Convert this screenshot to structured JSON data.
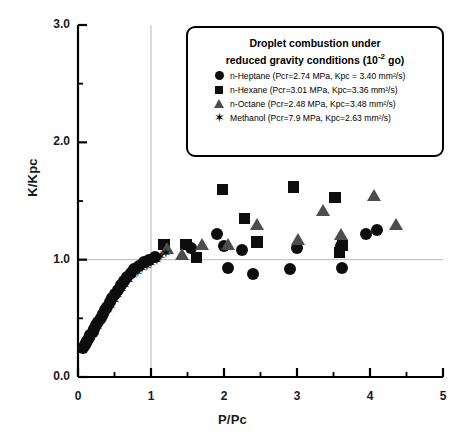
{
  "chart_data": {
    "type": "scatter",
    "title": "",
    "xlabel": "P/Pc",
    "ylabel": "K/Kpc",
    "xlim": [
      0,
      5
    ],
    "ylim": [
      0,
      3.0
    ],
    "xticks": [
      0,
      1,
      2,
      3,
      4,
      5
    ],
    "xtick_labels": [
      "0",
      "1",
      "2",
      "3",
      "4",
      "5"
    ],
    "yticks": [
      0.0,
      1.0,
      2.0,
      3.0
    ],
    "ytick_labels": [
      "0.0",
      "1.0",
      "2.0",
      "3.0"
    ],
    "minor_xtick_interval": 0.5,
    "minor_ytick_interval": 0.5,
    "grid": "reference lines at x=1.0 and y=1.0",
    "gridlines": {
      "vertical": [
        1.0
      ],
      "horizontal": [
        1.0
      ],
      "color": "#b9b9b9"
    },
    "legend_position": "top-right inside plot",
    "legend_title_line1": "Droplet combustion under",
    "legend_title_line2": "reduced gravity conditions (10-2 go)",
    "series": [
      {
        "name": "n-Heptane",
        "marker": "circle",
        "color": "#0d0d0d",
        "label": "n-Heptane (Pcr=2.74 MPa, Kpc = 3.40 mm²/s)",
        "Pcr_MPa": 2.74,
        "Kpc_mm2_s": 3.4,
        "points": [
          [
            0.07,
            0.25
          ],
          [
            0.09,
            0.27
          ],
          [
            0.11,
            0.29
          ],
          [
            0.13,
            0.31
          ],
          [
            0.15,
            0.33
          ],
          [
            0.17,
            0.36
          ],
          [
            0.2,
            0.38
          ],
          [
            0.22,
            0.41
          ],
          [
            0.25,
            0.44
          ],
          [
            0.28,
            0.47
          ],
          [
            0.31,
            0.5
          ],
          [
            0.34,
            0.54
          ],
          [
            0.37,
            0.57
          ],
          [
            0.4,
            0.6
          ],
          [
            0.44,
            0.64
          ],
          [
            0.47,
            0.67
          ],
          [
            0.51,
            0.71
          ],
          [
            0.55,
            0.74
          ],
          [
            0.59,
            0.78
          ],
          [
            0.63,
            0.82
          ],
          [
            0.67,
            0.85
          ],
          [
            0.72,
            0.89
          ],
          [
            0.77,
            0.92
          ],
          [
            0.83,
            0.95
          ],
          [
            0.9,
            0.98
          ],
          [
            0.97,
            1.0
          ],
          [
            1.05,
            1.02
          ],
          [
            1.55,
            1.1
          ],
          [
            1.9,
            1.22
          ],
          [
            2.0,
            1.12
          ],
          [
            2.05,
            0.93
          ],
          [
            2.25,
            1.08
          ],
          [
            2.4,
            0.88
          ],
          [
            2.9,
            0.92
          ],
          [
            3.0,
            1.1
          ],
          [
            3.6,
            1.12
          ],
          [
            3.62,
            0.93
          ],
          [
            3.95,
            1.22
          ],
          [
            4.1,
            1.25
          ]
        ]
      },
      {
        "name": "n-Hexane",
        "marker": "square",
        "color": "#0d0d0d",
        "label": "n-Hexane (Pcr=3.01 MPa, Kpc=3.36 mm²/s)",
        "Pcr_MPa": 3.01,
        "Kpc_mm2_s": 3.36,
        "points": [
          [
            1.18,
            1.13
          ],
          [
            1.48,
            1.13
          ],
          [
            1.62,
            1.02
          ],
          [
            1.98,
            1.6
          ],
          [
            2.28,
            1.35
          ],
          [
            2.45,
            1.15
          ],
          [
            2.95,
            1.62
          ],
          [
            3.52,
            1.53
          ],
          [
            3.62,
            1.12
          ],
          [
            3.58,
            1.06
          ]
        ]
      },
      {
        "name": "n-Octane",
        "marker": "triangle",
        "color": "#4d4d4d",
        "label": "n-Octane (Pcr=2.48 MPa, Kpc=3.48 mm²/s)",
        "Pcr_MPa": 2.48,
        "Kpc_mm2_s": 3.48,
        "points": [
          [
            1.22,
            1.1
          ],
          [
            1.42,
            1.05
          ],
          [
            1.7,
            1.13
          ],
          [
            2.05,
            1.13
          ],
          [
            2.45,
            1.3
          ],
          [
            3.02,
            1.18
          ],
          [
            3.35,
            1.42
          ],
          [
            3.6,
            1.22
          ],
          [
            4.05,
            1.55
          ],
          [
            4.35,
            1.3
          ]
        ]
      },
      {
        "name": "Methanol",
        "marker": "star",
        "color": "#0d0d0d",
        "label": "Methanol (Pcr=7.9 MPa, Kpc=2.63 mm²/s)",
        "Pcr_MPa": 7.9,
        "Kpc_mm2_s": 2.63,
        "points": [
          [
            0.1,
            0.3
          ],
          [
            0.14,
            0.34
          ],
          [
            0.18,
            0.38
          ],
          [
            0.23,
            0.43
          ],
          [
            0.27,
            0.47
          ],
          [
            0.32,
            0.52
          ],
          [
            0.36,
            0.56
          ],
          [
            0.41,
            0.61
          ],
          [
            0.45,
            0.65
          ],
          [
            0.5,
            0.7
          ],
          [
            0.55,
            0.74
          ],
          [
            0.6,
            0.79
          ],
          [
            0.65,
            0.83
          ],
          [
            0.7,
            0.87
          ],
          [
            0.76,
            0.91
          ],
          [
            0.82,
            0.94
          ],
          [
            0.88,
            0.97
          ],
          [
            0.94,
            0.99
          ],
          [
            1.0,
            1.01
          ],
          [
            1.08,
            1.04
          ],
          [
            1.14,
            1.07
          ],
          [
            1.2,
            1.1
          ]
        ]
      }
    ]
  },
  "legend": {
    "title_line1": "Droplet combustion under",
    "title_line2_pre": "reduced gravity conditions (10",
    "title_line2_sup": "-2",
    "title_line2_post": " go)"
  }
}
